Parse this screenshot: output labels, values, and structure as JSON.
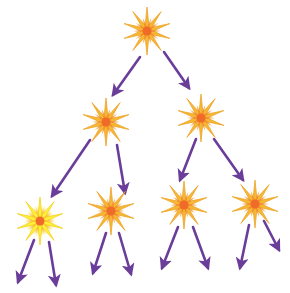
{
  "diagram": {
    "type": "branching-tree",
    "colors": {
      "arrow": "#6a3d9a",
      "star_outer": "#f6b733",
      "star_inner": "#f08a2a",
      "star_core": "#f06a2a",
      "star_bright_outer": "#fff23a",
      "background": "#ffffff"
    },
    "nodes": [
      {
        "id": "n0",
        "icon": "starburst-icon",
        "x": 147,
        "y": 31,
        "level": 0,
        "bright": false
      },
      {
        "id": "n1",
        "icon": "starburst-icon",
        "x": 106,
        "y": 122,
        "level": 1,
        "bright": false
      },
      {
        "id": "n2",
        "icon": "starburst-icon",
        "x": 201,
        "y": 118,
        "level": 1,
        "bright": false
      },
      {
        "id": "n3",
        "icon": "starburst-icon",
        "x": 40,
        "y": 221,
        "level": 2,
        "bright": true
      },
      {
        "id": "n4",
        "icon": "starburst-icon",
        "x": 111,
        "y": 211,
        "level": 2,
        "bright": false
      },
      {
        "id": "n5",
        "icon": "starburst-icon",
        "x": 184,
        "y": 205,
        "level": 2,
        "bright": false
      },
      {
        "id": "n6",
        "icon": "starburst-icon",
        "x": 255,
        "y": 204,
        "level": 2,
        "bright": false
      }
    ],
    "arrows": [
      {
        "from": "n0",
        "x1": 140,
        "y1": 57,
        "x2": 113,
        "y2": 95
      },
      {
        "from": "n0",
        "x1": 164,
        "y1": 52,
        "x2": 189,
        "y2": 88
      },
      {
        "from": "n1",
        "x1": 90,
        "y1": 140,
        "x2": 52,
        "y2": 196
      },
      {
        "from": "n1",
        "x1": 117,
        "y1": 145,
        "x2": 125,
        "y2": 193
      },
      {
        "from": "n2",
        "x1": 196,
        "y1": 139,
        "x2": 180,
        "y2": 180
      },
      {
        "from": "n2",
        "x1": 214,
        "y1": 139,
        "x2": 243,
        "y2": 180
      },
      {
        "from": "n3",
        "x1": 34,
        "y1": 240,
        "x2": 18,
        "y2": 282
      },
      {
        "from": "n3",
        "x1": 49,
        "y1": 242,
        "x2": 56,
        "y2": 285
      },
      {
        "from": "n4",
        "x1": 106,
        "y1": 233,
        "x2": 93,
        "y2": 273
      },
      {
        "from": "n4",
        "x1": 119,
        "y1": 233,
        "x2": 131,
        "y2": 274
      },
      {
        "from": "n5",
        "x1": 178,
        "y1": 227,
        "x2": 162,
        "y2": 268
      },
      {
        "from": "n5",
        "x1": 193,
        "y1": 227,
        "x2": 208,
        "y2": 268
      },
      {
        "from": "n6",
        "x1": 249,
        "y1": 225,
        "x2": 240,
        "y2": 268
      },
      {
        "from": "n6",
        "x1": 264,
        "y1": 221,
        "x2": 279,
        "y2": 250
      }
    ]
  }
}
